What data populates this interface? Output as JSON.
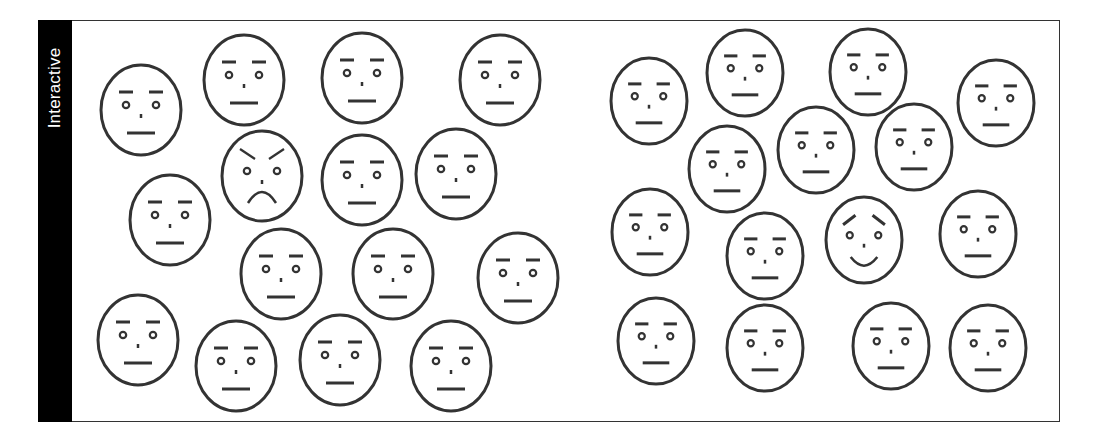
{
  "panel": {
    "label": "Interactive",
    "frame_color": "#333333",
    "label_bg": "#000000",
    "label_fg": "#ffffff"
  },
  "faces_left": [
    {
      "cx": 141,
      "cy": 110,
      "rx": 40,
      "ry": 45,
      "expression": "neutral"
    },
    {
      "cx": 244,
      "cy": 80,
      "rx": 40,
      "ry": 45,
      "expression": "neutral"
    },
    {
      "cx": 362,
      "cy": 78,
      "rx": 40,
      "ry": 45,
      "expression": "neutral"
    },
    {
      "cx": 500,
      "cy": 80,
      "rx": 40,
      "ry": 45,
      "expression": "neutral"
    },
    {
      "cx": 170,
      "cy": 220,
      "rx": 40,
      "ry": 45,
      "expression": "neutral"
    },
    {
      "cx": 262,
      "cy": 176,
      "rx": 40,
      "ry": 45,
      "expression": "angry"
    },
    {
      "cx": 362,
      "cy": 180,
      "rx": 40,
      "ry": 45,
      "expression": "neutral"
    },
    {
      "cx": 456,
      "cy": 174,
      "rx": 40,
      "ry": 45,
      "expression": "neutral"
    },
    {
      "cx": 281,
      "cy": 274,
      "rx": 40,
      "ry": 45,
      "expression": "neutral"
    },
    {
      "cx": 393,
      "cy": 274,
      "rx": 40,
      "ry": 45,
      "expression": "neutral"
    },
    {
      "cx": 518,
      "cy": 278,
      "rx": 40,
      "ry": 45,
      "expression": "neutral"
    },
    {
      "cx": 138,
      "cy": 340,
      "rx": 40,
      "ry": 45,
      "expression": "neutral"
    },
    {
      "cx": 236,
      "cy": 366,
      "rx": 40,
      "ry": 45,
      "expression": "neutral"
    },
    {
      "cx": 340,
      "cy": 360,
      "rx": 40,
      "ry": 45,
      "expression": "neutral"
    },
    {
      "cx": 451,
      "cy": 366,
      "rx": 40,
      "ry": 45,
      "expression": "neutral"
    }
  ],
  "faces_right": [
    {
      "cx": 649,
      "cy": 101,
      "rx": 38,
      "ry": 43,
      "expression": "neutral"
    },
    {
      "cx": 745,
      "cy": 73,
      "rx": 38,
      "ry": 43,
      "expression": "neutral"
    },
    {
      "cx": 868,
      "cy": 72,
      "rx": 38,
      "ry": 43,
      "expression": "neutral"
    },
    {
      "cx": 996,
      "cy": 103,
      "rx": 38,
      "ry": 43,
      "expression": "neutral"
    },
    {
      "cx": 727,
      "cy": 169,
      "rx": 38,
      "ry": 43,
      "expression": "neutral"
    },
    {
      "cx": 816,
      "cy": 150,
      "rx": 38,
      "ry": 43,
      "expression": "neutral"
    },
    {
      "cx": 914,
      "cy": 147,
      "rx": 38,
      "ry": 43,
      "expression": "neutral"
    },
    {
      "cx": 650,
      "cy": 232,
      "rx": 38,
      "ry": 43,
      "expression": "neutral"
    },
    {
      "cx": 765,
      "cy": 256,
      "rx": 38,
      "ry": 43,
      "expression": "neutral"
    },
    {
      "cx": 864,
      "cy": 240,
      "rx": 38,
      "ry": 43,
      "expression": "happy"
    },
    {
      "cx": 978,
      "cy": 234,
      "rx": 38,
      "ry": 43,
      "expression": "neutral"
    },
    {
      "cx": 656,
      "cy": 341,
      "rx": 38,
      "ry": 43,
      "expression": "neutral"
    },
    {
      "cx": 765,
      "cy": 348,
      "rx": 38,
      "ry": 43,
      "expression": "neutral"
    },
    {
      "cx": 891,
      "cy": 346,
      "rx": 38,
      "ry": 43,
      "expression": "neutral"
    },
    {
      "cx": 988,
      "cy": 348,
      "rx": 38,
      "ry": 43,
      "expression": "neutral"
    }
  ],
  "stroke_color": "#333333"
}
